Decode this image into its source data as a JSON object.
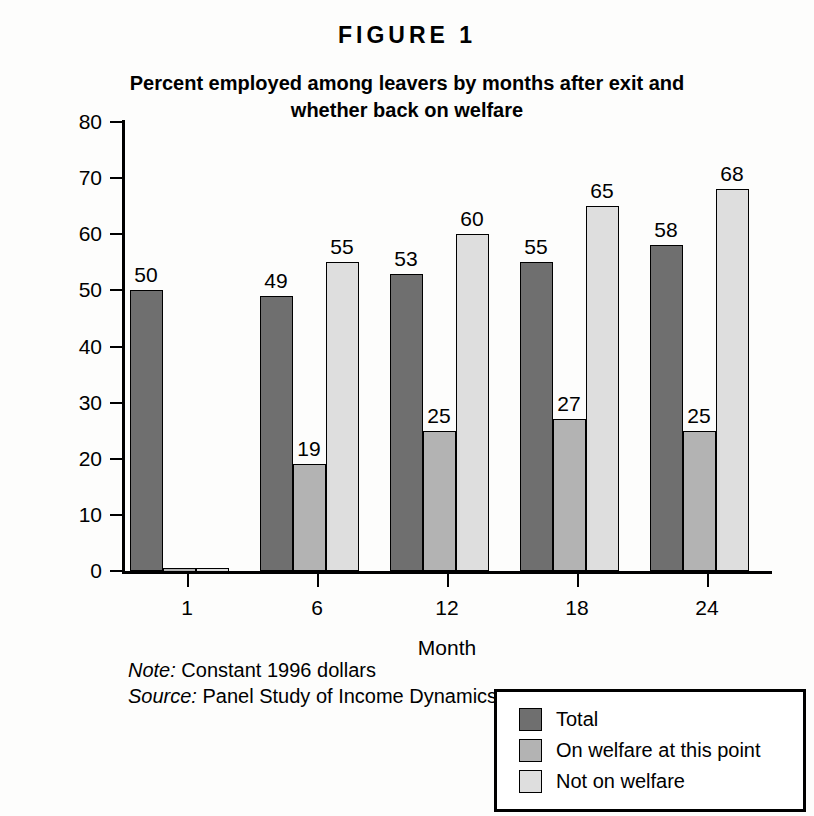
{
  "figure": {
    "number_label": "FIGURE 1",
    "title": "Percent employed among leavers by months after exit and whether back on welfare"
  },
  "notes": {
    "note_lead": "Note:",
    "note_text": " Constant 1996 dollars",
    "source_lead": "Source:",
    "source_text": " Panel Study of Income Dynamics"
  },
  "legend": {
    "position": "bottom-right",
    "items": [
      {
        "label": "Total",
        "color": "#6f6f6f"
      },
      {
        "label": "On welfare at this point",
        "color": "#b3b3b3"
      },
      {
        "label": "Not on welfare",
        "color": "#dedede"
      }
    ]
  },
  "chart_data": {
    "type": "bar",
    "title": "Percent employed among leavers by months after exit and whether back on welfare",
    "xlabel": "Month",
    "ylabel": "Percent",
    "categories": [
      "1",
      "6",
      "12",
      "18",
      "24"
    ],
    "ylim": [
      0,
      80
    ],
    "yticks": [
      0,
      10,
      20,
      30,
      40,
      50,
      60,
      70,
      80
    ],
    "grid": false,
    "legend_position": "bottom-right",
    "series": [
      {
        "name": "Total",
        "color": "#6f6f6f",
        "values": [
          50,
          49,
          53,
          55,
          58
        ]
      },
      {
        "name": "On welfare at this point",
        "color": "#b3b3b3",
        "values": [
          0,
          19,
          25,
          27,
          25
        ]
      },
      {
        "name": "Not on welfare",
        "color": "#dedede",
        "values": [
          0,
          55,
          60,
          65,
          68
        ]
      }
    ],
    "data_labels": [
      [
        "50",
        "",
        ""
      ],
      [
        "49",
        "19",
        "55"
      ],
      [
        "53",
        "25",
        "60"
      ],
      [
        "55",
        "27",
        "65"
      ],
      [
        "58",
        "25",
        "68"
      ]
    ]
  }
}
